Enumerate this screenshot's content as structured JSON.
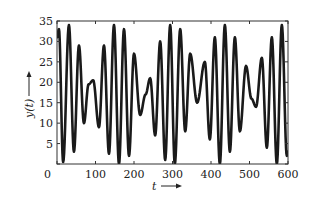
{
  "chart_data": {
    "type": "line",
    "title": "",
    "xlabel": "t",
    "ylabel": "y(t)",
    "xlim": [
      0,
      600
    ],
    "ylim": [
      0,
      35
    ],
    "xticks": [
      0,
      100,
      200,
      300,
      400,
      500,
      600
    ],
    "yticks": [
      0,
      5,
      10,
      15,
      20,
      25,
      30,
      35
    ],
    "xtick_labels": [
      "0",
      "100",
      "200",
      "300",
      "400",
      "500",
      "600"
    ],
    "ytick_labels": [
      "0",
      "5",
      "10",
      "15",
      "20",
      "25",
      "30",
      "35"
    ],
    "grid": false,
    "legend": null,
    "series": [
      {
        "name": "y(t)",
        "color": "#1a1a1a",
        "x": [
          0,
          5,
          16,
          31,
          44,
          57,
          70,
          82,
          94,
          109,
          122,
          135,
          148,
          161,
          174,
          187,
          200,
          216,
          230,
          242,
          255,
          268,
          281,
          294,
          306,
          320,
          333,
          346,
          364,
          384,
          397,
          410,
          423,
          436,
          449,
          462,
          475,
          491,
          505,
          517,
          532,
          545,
          558,
          571,
          584,
          597,
          600
        ],
        "values": [
          31,
          33,
          0.5,
          34,
          3,
          29,
          10,
          19.5,
          20.5,
          9,
          29,
          2.5,
          34,
          0,
          33,
          2,
          27,
          12,
          17,
          21,
          7,
          30,
          1,
          34,
          0,
          33,
          8,
          27,
          15,
          25,
          6,
          31,
          0,
          34,
          3,
          31,
          8,
          24,
          16,
          14,
          26,
          4,
          31,
          0,
          34,
          2,
          3
        ]
      }
    ]
  },
  "axes": {
    "x_label": "t",
    "y_label": "y(t)",
    "x_ticks": [
      "0",
      "100",
      "200",
      "300",
      "400",
      "500",
      "600"
    ],
    "y_ticks": [
      "0",
      "5",
      "10",
      "15",
      "20",
      "25",
      "30",
      "35"
    ]
  }
}
